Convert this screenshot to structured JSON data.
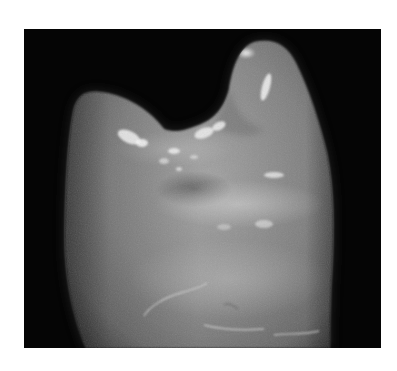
{
  "image": {
    "subject": "Photograph of a tooth crown (molar/premolar) in grayscale on a black background",
    "alt_text": "Grayscale photograph of a tooth with two cusps and a central fissure",
    "colors": {
      "page_background": "#ffffff",
      "photo_background": "#050505",
      "tooth_mid": "#8a8a8a",
      "tooth_highlight": "#e6e6e6",
      "tooth_shadow": "#5e5e5e"
    }
  }
}
